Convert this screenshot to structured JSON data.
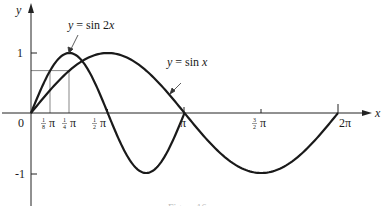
{
  "chart_data": {
    "type": "line",
    "title": "",
    "xlabel": "x",
    "ylabel": "y",
    "xlim": [
      0,
      6.2832
    ],
    "ylim": [
      -1,
      1
    ],
    "grid": false,
    "x_ticks": [
      {
        "value": 0.3927,
        "label": "1/8 π"
      },
      {
        "value": 0.7854,
        "label": "1/4 π"
      },
      {
        "value": 1.5708,
        "label": "1/2 π"
      },
      {
        "value": 3.1416,
        "label": "π"
      },
      {
        "value": 4.7124,
        "label": "3/2 π"
      },
      {
        "value": 6.2832,
        "label": "2π"
      }
    ],
    "y_ticks": [
      {
        "value": 1,
        "label": "1"
      },
      {
        "value": -1,
        "label": "-1"
      }
    ],
    "origin_label": "0",
    "series": [
      {
        "name": "y = sin 2x",
        "function": "sin(2x)",
        "domain": [
          0,
          3.1416
        ],
        "x": [
          0,
          0.3927,
          0.7854,
          1.1781,
          1.5708,
          1.9635,
          2.3562,
          2.7489,
          3.1416
        ],
        "values": [
          0,
          0.707,
          1,
          0.707,
          0,
          -0.707,
          -1,
          -0.707,
          0
        ]
      },
      {
        "name": "y = sin x",
        "function": "sin(x)",
        "domain": [
          0,
          6.2832
        ],
        "x": [
          0,
          0.7854,
          1.5708,
          2.3562,
          3.1416,
          3.927,
          4.7124,
          5.4978,
          6.2832
        ],
        "values": [
          0,
          0.707,
          1,
          0.707,
          0,
          -0.707,
          -1,
          -0.707,
          0
        ]
      }
    ],
    "annotations": [
      {
        "text": "y = sin 2x",
        "points_to": "sin 2x curve near peak"
      },
      {
        "text": "y = sin x",
        "points_to": "sin x curve descending toward π"
      },
      {
        "guide": "vertical lines at x = 1/8 π and 1/4 π, horizontal line at y = sin(π/4) ≈ 0.707"
      }
    ]
  },
  "labels": {
    "y_axis": "y",
    "x_axis": "x",
    "origin": "0",
    "y_one": "1",
    "y_neg_one": "-1",
    "pi": "π",
    "two_pi": "2π",
    "sin2x_prefix": "y",
    "sin2x_rest": " = sin 2",
    "sin2x_var": "x",
    "sinx_prefix": "y",
    "sinx_rest": " = sin ",
    "sinx_var": "x",
    "frac_one": "1",
    "frac_eighth": "8",
    "frac_quarter": "4",
    "frac_half": "2",
    "frac_three": "3",
    "caption": "Figure 16"
  }
}
